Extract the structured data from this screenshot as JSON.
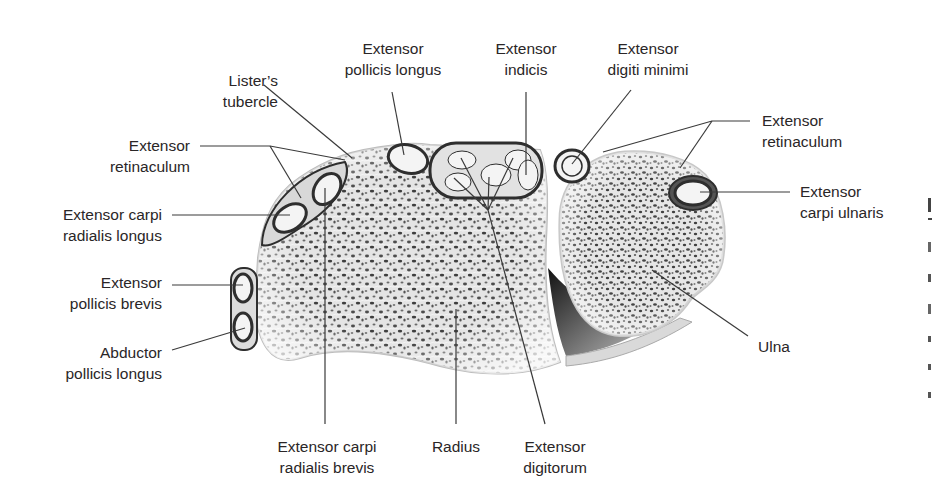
{
  "figure": {
    "type": "anatomical cross-section",
    "colors": {
      "background": "#ffffff",
      "text": "#2a2627",
      "leader": "#3a3a3a",
      "bone_fill": "#e9e9e9",
      "bone_pore": "#4a4a4a",
      "tendon": "#f4f4f4",
      "sheath": "#2e2e2e"
    }
  },
  "labels": {
    "listers_tubercle": {
      "line1": "Lister’s",
      "line2": "tubercle"
    },
    "extensor_retinaculum_left": {
      "line1": "Extensor",
      "line2": "retinaculum"
    },
    "extensor_carpi_radialis_longus": {
      "line1": "Extensor carpi",
      "line2": "radialis longus"
    },
    "extensor_pollicis_brevis": {
      "line1": "Extensor",
      "line2": "pollicis brevis"
    },
    "abductor_pollicis_longus": {
      "line1": "Abductor",
      "line2": "pollicis longus"
    },
    "extensor_pollicis_longus": {
      "line1": "Extensor",
      "line2": "pollicis longus"
    },
    "extensor_indicis": {
      "line1": "Extensor",
      "line2": "indicis"
    },
    "extensor_digiti_minimi": {
      "line1": "Extensor",
      "line2": "digiti minimi"
    },
    "extensor_retinaculum_right": {
      "line1": "Extensor",
      "line2": "retinaculum"
    },
    "extensor_carpi_ulnaris": {
      "line1": "Extensor",
      "line2": "carpi ulnaris"
    },
    "ulna": {
      "line1": "Ulna"
    },
    "extensor_carpi_radialis_brevis": {
      "line1": "Extensor carpi",
      "line2": "radialis brevis"
    },
    "radius": {
      "line1": "Radius"
    },
    "extensor_digitorum": {
      "line1": "Extensor",
      "line2": "digitorum"
    }
  },
  "structures": [
    "Radius",
    "Ulna",
    "Lister’s tubercle",
    "Extensor retinaculum",
    "Abductor pollicis longus",
    "Extensor pollicis brevis",
    "Extensor carpi radialis longus",
    "Extensor carpi radialis brevis",
    "Extensor pollicis longus",
    "Extensor digitorum",
    "Extensor indicis",
    "Extensor digiti minimi",
    "Extensor carpi ulnaris"
  ]
}
